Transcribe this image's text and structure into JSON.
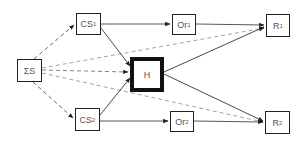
{
  "diagram": {
    "nodes": [
      {
        "id": "SS",
        "label": "ΣS",
        "sub": "",
        "x": 17,
        "y": 59,
        "w": 25,
        "h": 23,
        "thick": false
      },
      {
        "id": "CS1",
        "label": "CS",
        "sub": "1",
        "x": 76,
        "y": 13,
        "w": 25,
        "h": 22,
        "thick": false
      },
      {
        "id": "CS2",
        "label": "CS",
        "sub": "2",
        "x": 75,
        "y": 108,
        "w": 25,
        "h": 23,
        "thick": false
      },
      {
        "id": "H",
        "label": "H",
        "sub": "",
        "x": 130,
        "y": 57,
        "w": 34,
        "h": 35,
        "thick": true
      },
      {
        "id": "Or1",
        "label": "Or",
        "sub": "1",
        "x": 172,
        "y": 14,
        "w": 24,
        "h": 21,
        "thick": false
      },
      {
        "id": "Or2",
        "label": "Or",
        "sub": "2",
        "x": 170,
        "y": 111,
        "w": 24,
        "h": 21,
        "thick": false
      },
      {
        "id": "R1",
        "label": "R",
        "sub": "1",
        "x": 266,
        "y": 14,
        "w": 24,
        "h": 23,
        "thick": false
      },
      {
        "id": "R2",
        "label": "R",
        "sub": "2",
        "x": 265,
        "y": 111,
        "w": 25,
        "h": 23,
        "thick": false
      }
    ],
    "edges": [
      {
        "from": "SS",
        "to": "CS1",
        "style": "dashed"
      },
      {
        "from": "SS",
        "to": "CS2",
        "style": "dashed"
      },
      {
        "from": "SS",
        "to": "H",
        "style": "dashed"
      },
      {
        "from": "SS",
        "to": "R1",
        "style": "dashed"
      },
      {
        "from": "SS",
        "to": "R2",
        "style": "dashed"
      },
      {
        "from": "CS1",
        "to": "Or1",
        "style": "solid"
      },
      {
        "from": "CS1",
        "to": "H",
        "style": "solid"
      },
      {
        "from": "CS2",
        "to": "Or2",
        "style": "solid"
      },
      {
        "from": "CS2",
        "to": "H",
        "style": "solid"
      },
      {
        "from": "Or1",
        "to": "R1",
        "style": "solid"
      },
      {
        "from": "Or2",
        "to": "R2",
        "style": "solid"
      },
      {
        "from": "H",
        "to": "R1",
        "style": "solid"
      },
      {
        "from": "H",
        "to": "R2",
        "style": "solid"
      }
    ]
  },
  "labels": {
    "SS": "ΣS",
    "CS1": "CS",
    "CS1_sub": "1",
    "CS2": "CS",
    "CS2_sub": "2",
    "H": "H",
    "Or1": "Or",
    "Or1_sub": "1",
    "Or2": "Or",
    "Or2_sub": "2",
    "R1": "R",
    "R1_sub": "1",
    "R2": "R",
    "R2_sub": "2"
  },
  "colors": {
    "stroke": "#222222",
    "dashed": "#555555",
    "text": "#555555"
  }
}
